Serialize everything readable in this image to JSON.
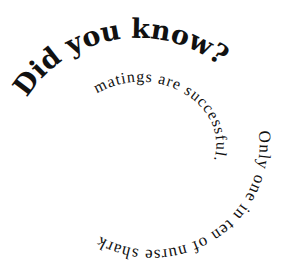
{
  "spiral": {
    "headline": "Did you know?",
    "segment_outer": "Only one in ten of nurse shark",
    "segment_inner": "matings are successful.",
    "full_text": "Did you know? Only one in ten of nurse shark matings are successful.",
    "text_color": "#111111",
    "background": "#ffffff"
  }
}
